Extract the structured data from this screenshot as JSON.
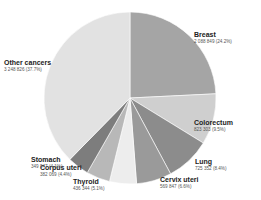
{
  "chart_data": {
    "type": "pie",
    "title": "",
    "start": "12 o'clock",
    "direction": "clockwise",
    "legend": "none",
    "slices": [
      {
        "name": "Breast",
        "value": 2088849,
        "value_label": "2 088 849 (24.2%)",
        "percent": 24.2,
        "color": "#a5a5a5"
      },
      {
        "name": "Colorectum",
        "value": 823303,
        "value_label": "823 303 (9.5%)",
        "percent": 9.5,
        "color": "#cfcfcf"
      },
      {
        "name": "Lung",
        "value": 725352,
        "value_label": "725 352 (8.4%)",
        "percent": 8.4,
        "color": "#8c8c8c"
      },
      {
        "name": "Cervix uteri",
        "value": 569847,
        "value_label": "569 847 (6.6%)",
        "percent": 6.6,
        "color": "#9a9a9a"
      },
      {
        "name": "Thyroid",
        "value": 436344,
        "value_label": "436 344 (5.1%)",
        "percent": 5.1,
        "color": "#ededed"
      },
      {
        "name": "Corpus uteri",
        "value": 382069,
        "value_label": "382 069 (4.4%)",
        "percent": 4.4,
        "color": "#b8b8b8"
      },
      {
        "name": "Stomach",
        "value": 349947,
        "value_label": "349 947 (4.1%)",
        "percent": 4.1,
        "color": "#7d7d7d"
      },
      {
        "name": "Other cancers",
        "value": 3248826,
        "value_label": "3 248 826 (37.7%)",
        "percent": 37.7,
        "color": "#e2e2e2"
      }
    ]
  }
}
